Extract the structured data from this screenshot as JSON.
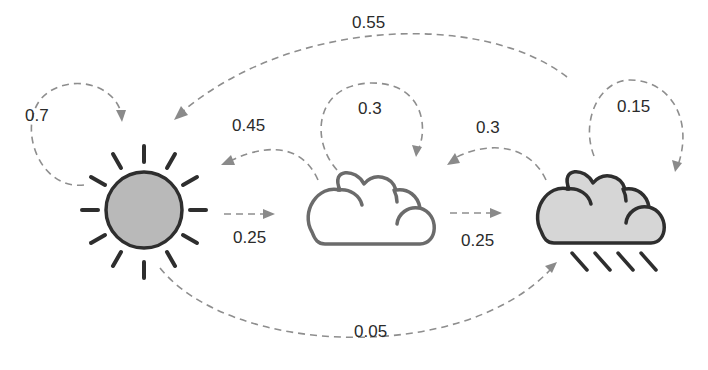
{
  "diagram": {
    "type": "markov-chain",
    "title": "",
    "colors": {
      "edge": "#8e8e8e",
      "outline_dark": "#2e2e2e",
      "outline_gray": "#6b6b6b",
      "sun_fill": "#b9b9b9",
      "rain_cloud_fill": "#d6d6d6",
      "label_text": "#2b2b2b"
    },
    "states": [
      {
        "id": "sunny",
        "icon": "sun-icon"
      },
      {
        "id": "cloudy",
        "icon": "cloud-icon"
      },
      {
        "id": "rainy",
        "icon": "rain-cloud-icon"
      }
    ],
    "transitions": [
      {
        "from": "sunny",
        "to": "sunny",
        "prob": "0.7"
      },
      {
        "from": "sunny",
        "to": "cloudy",
        "prob": "0.25"
      },
      {
        "from": "sunny",
        "to": "rainy",
        "prob": "0.05"
      },
      {
        "from": "cloudy",
        "to": "sunny",
        "prob": "0.45"
      },
      {
        "from": "cloudy",
        "to": "cloudy",
        "prob": "0.3"
      },
      {
        "from": "cloudy",
        "to": "rainy",
        "prob": "0.25"
      },
      {
        "from": "rainy",
        "to": "sunny",
        "prob": "0.55"
      },
      {
        "from": "rainy",
        "to": "cloudy",
        "prob": "0.3"
      },
      {
        "from": "rainy",
        "to": "rainy",
        "prob": "0.15"
      }
    ]
  }
}
